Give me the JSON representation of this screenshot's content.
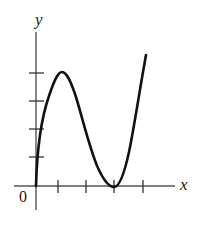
{
  "figure": {
    "background_color": "#ffffff",
    "width": 199,
    "height": 226
  },
  "labels": {
    "y_axis": "y",
    "x_axis": "x",
    "origin": "0"
  },
  "colors": {
    "curve": "#111111",
    "axis": "#555555",
    "tick": "#333333",
    "text": "#1a1a1a"
  },
  "chart_data": {
    "type": "line",
    "xlabel": "x",
    "ylabel": "y",
    "grid": false,
    "legend": null,
    "axes": {
      "origin_label": "0",
      "x_axis_pixel_y": 186,
      "y_axis_pixel_x": 36,
      "x_axis_extent_px": [
        14,
        175
      ],
      "y_axis_extent_px": [
        32,
        210
      ],
      "x_tick_positions_px": [
        58,
        86,
        114,
        143
      ],
      "y_tick_positions_px": [
        73,
        101,
        129,
        157
      ],
      "x_tick_labels": [
        "",
        "",
        "",
        ""
      ],
      "y_tick_labels": [
        "",
        "",
        "",
        ""
      ],
      "x_tick_count": 4,
      "y_tick_count": 4,
      "tick_spacing_px": 28,
      "xlim": [
        0,
        5
      ],
      "ylim": [
        0,
        5
      ]
    },
    "annotations": [
      {
        "name": "local-maximum",
        "x": 0.93,
        "y": 4.04,
        "pixel": [
          62,
          72
        ]
      },
      {
        "name": "local-minimum-on-x-axis",
        "x": 2.79,
        "y": 0.0,
        "pixel": [
          114,
          186
        ]
      },
      {
        "name": "curve-start-at-origin",
        "x": 0.0,
        "y": 0.0,
        "pixel": [
          36,
          186
        ]
      },
      {
        "name": "curve-end-upper-right",
        "x": 3.93,
        "y": 4.68,
        "pixel": [
          146,
          55
        ]
      }
    ],
    "curve_path_px": "M 36,186 C 37,150 42,116 49,96 C 54,81 58,72 62,72 C 67,72 71,82 76,97 C 83,120 90,150 98,168 C 104,181 109,187 114,187 C 119,187 124,175 129,152 C 134,128 140,88 146,55",
    "x": [
      0.0,
      0.18,
      0.36,
      0.54,
      0.71,
      0.93,
      1.14,
      1.36,
      1.68,
      2.0,
      2.21,
      2.5,
      2.79,
      3.0,
      3.21,
      3.5,
      3.75,
      3.93
    ],
    "y": [
      0.0,
      1.4,
      2.5,
      3.3,
      3.8,
      4.04,
      3.9,
      3.5,
      2.7,
      1.75,
      1.2,
      0.4,
      0.0,
      0.2,
      0.75,
      1.8,
      3.2,
      4.68
    ]
  }
}
